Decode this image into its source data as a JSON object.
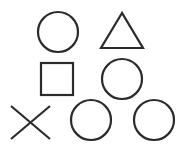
{
  "diagram": {
    "stroke_color": "#2b2b2b",
    "background": "#ffffff",
    "stroke_width": 2.2,
    "shapes": [
      {
        "type": "circle",
        "cx": 58,
        "cy": 32,
        "r": 20
      },
      {
        "type": "triangle",
        "points": "122,13 101,48 143,48"
      },
      {
        "type": "square",
        "x": 41,
        "y": 63,
        "w": 32,
        "h": 32
      },
      {
        "type": "circle",
        "cx": 122,
        "cy": 79,
        "r": 20
      },
      {
        "type": "cross",
        "x1": 11,
        "y1": 106,
        "x2": 50,
        "y2": 139
      },
      {
        "type": "circle",
        "cx": 91,
        "cy": 120,
        "r": 20
      },
      {
        "type": "circle",
        "cx": 154,
        "cy": 120,
        "r": 20
      }
    ]
  }
}
